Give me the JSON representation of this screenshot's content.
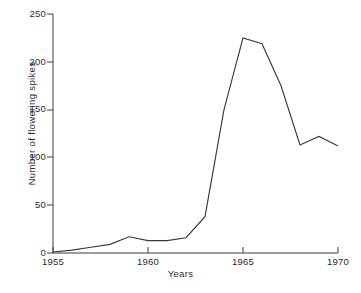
{
  "chart_data": {
    "type": "line",
    "title": "",
    "xlabel": "Years",
    "ylabel": "Number of flowering spikes",
    "x": [
      1955,
      1956,
      1957,
      1958,
      1959,
      1960,
      1961,
      1962,
      1963,
      1964,
      1965,
      1966,
      1967,
      1968,
      1969,
      1970
    ],
    "values": [
      1,
      3,
      6,
      9,
      17,
      13,
      13,
      16,
      38,
      150,
      225,
      219,
      175,
      113,
      122,
      112
    ],
    "series": [
      {
        "name": "Number of flowering spikes",
        "values": [
          1,
          3,
          6,
          9,
          17,
          13,
          13,
          16,
          38,
          150,
          225,
          219,
          175,
          113,
          122,
          112
        ]
      }
    ],
    "xlim": [
      1955,
      1970
    ],
    "ylim": [
      0,
      250
    ],
    "xticks": [
      1955,
      1960,
      1965,
      1970
    ],
    "yticks": [
      0,
      50,
      100,
      150,
      200,
      250
    ],
    "xtick_labels": [
      "1955",
      "1960",
      "1965",
      "1970"
    ],
    "ytick_labels": [
      "0",
      "50",
      "100",
      "150",
      "200",
      "250"
    ],
    "grid": false,
    "legend": false,
    "legend_position": "none",
    "line_color": "#3a3a3a",
    "axis_color": "#3a3a3a",
    "background_color": "#ffffff",
    "markers": false
  },
  "axes": {
    "y_title": "Number of flowering spikes",
    "x_title": "Years"
  },
  "ticks": {
    "y": [
      {
        "label": "250",
        "value": 250
      },
      {
        "label": "200",
        "value": 200
      },
      {
        "label": "150",
        "value": 150
      },
      {
        "label": "100",
        "value": 100
      },
      {
        "label": "50",
        "value": 50
      },
      {
        "label": "0",
        "value": 0
      }
    ],
    "x": [
      {
        "label": "1955",
        "value": 1955
      },
      {
        "label": "1960",
        "value": 1960
      },
      {
        "label": "1965",
        "value": 1965
      },
      {
        "label": "1970",
        "value": 1970
      }
    ]
  }
}
